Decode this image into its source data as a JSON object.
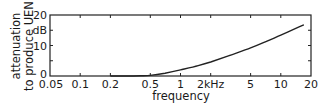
{
  "chart_data": {
    "type": "line",
    "title": "",
    "xlabel": "frequency",
    "ylabel_line1": "attenuation",
    "ylabel_line2": "to produce UEN",
    "yunit": "dB",
    "xscale": "log",
    "xlim": [
      0.05,
      20
    ],
    "ylim": [
      0,
      20
    ],
    "grid": false,
    "legend": null,
    "x_ticks": [
      {
        "value": 0.05,
        "label": "0.05"
      },
      {
        "value": 0.1,
        "label": "0.1"
      },
      {
        "value": 0.2,
        "label": "0.2"
      },
      {
        "value": 0.5,
        "label": "0.5"
      },
      {
        "value": 1,
        "label": "1"
      },
      {
        "value": 2,
        "label": "2kHz"
      },
      {
        "value": 5,
        "label": "5"
      },
      {
        "value": 10,
        "label": "10"
      },
      {
        "value": 20,
        "label": "20"
      }
    ],
    "y_ticks": [
      {
        "value": 0,
        "label": "0"
      },
      {
        "value": 5,
        "label": ""
      },
      {
        "value": 10,
        "label": "10"
      },
      {
        "value": 15,
        "label": "dB"
      },
      {
        "value": 20,
        "label": "20"
      }
    ],
    "series": [
      {
        "name": "attenuation to produce UEN",
        "x": [
          0.2,
          0.3,
          0.4,
          0.5,
          0.7,
          1,
          1.5,
          2,
          3,
          5,
          7,
          10,
          15,
          17
        ],
        "y": [
          0,
          0,
          0.05,
          0.2,
          0.9,
          2.0,
          3.4,
          4.6,
          6.6,
          9.2,
          11.2,
          13.4,
          16.0,
          16.8
        ]
      }
    ]
  }
}
